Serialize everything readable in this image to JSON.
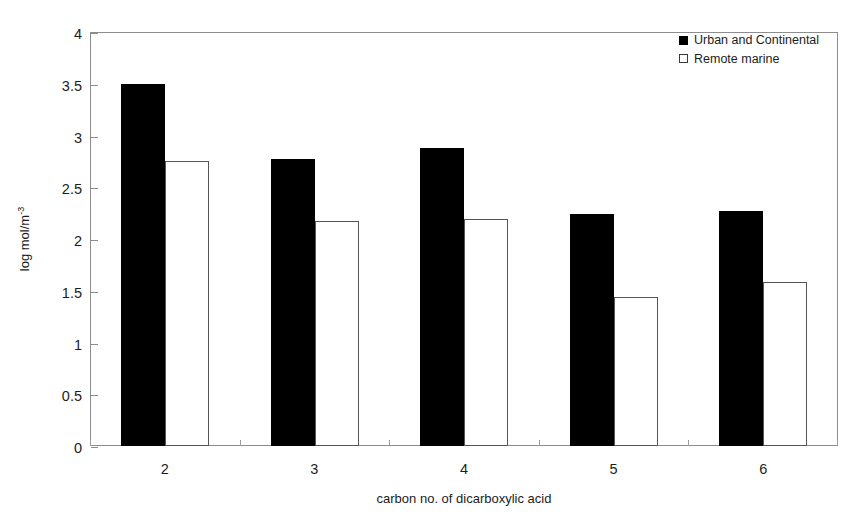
{
  "chart_data": {
    "type": "bar",
    "title": "",
    "xlabel": "carbon no. of dicarboxylic acid",
    "ylabel": "log mol/m",
    "ylabel_sup": "-3",
    "categories": [
      "2",
      "3",
      "4",
      "5",
      "6"
    ],
    "ylim": [
      0,
      4
    ],
    "yticks": [
      "0",
      "0.5",
      "1",
      "1.5",
      "2",
      "2.5",
      "3",
      "3.5",
      "4"
    ],
    "ytick_values": [
      0,
      0.5,
      1,
      1.5,
      2,
      2.5,
      3,
      3.5,
      4
    ],
    "grid": false,
    "legend_position": "top-right",
    "series": [
      {
        "name": "Urban and Continental",
        "color": "#000000",
        "fill": "solid",
        "values": [
          3.5,
          2.77,
          2.88,
          2.24,
          2.27
        ]
      },
      {
        "name": "Remote marine",
        "color": "#ffffff",
        "fill": "open",
        "values": [
          2.75,
          2.17,
          2.19,
          1.44,
          1.58
        ]
      }
    ]
  },
  "legend": {
    "items": [
      {
        "label": "Urban and Continental",
        "swatch": "filled-square-icon"
      },
      {
        "label": "Remote marine",
        "swatch": "open-square-icon"
      }
    ]
  }
}
